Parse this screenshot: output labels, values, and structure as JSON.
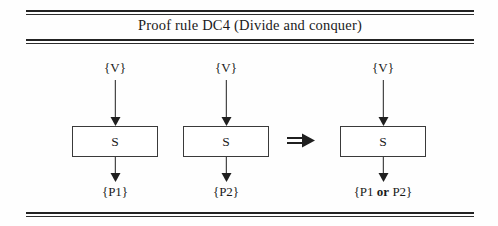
{
  "figure": {
    "title": "Proof rule DC4 (Divide and conquer)",
    "rules": {
      "top": "double-rule",
      "under_title": "double-rule",
      "bottom": "double-rule"
    },
    "colors": {
      "ink": "#1f1f1f",
      "rule": "#232323",
      "box_border": "#3a3a3a",
      "background": "#ffffff"
    },
    "operator": {
      "name": "implies-arrow",
      "glyph": "⇒",
      "meaning": "implies"
    },
    "columns": [
      {
        "id": "premise-1",
        "precondition": "{V}",
        "statement": "S",
        "postcondition": "{P1}",
        "postcondition_parts": [
          {
            "text": "{P1}",
            "bold": false
          }
        ]
      },
      {
        "id": "premise-2",
        "precondition": "{V}",
        "statement": "S",
        "postcondition": "{P2}",
        "postcondition_parts": [
          {
            "text": "{P2}",
            "bold": false
          }
        ]
      },
      {
        "id": "conclusion",
        "precondition": "{V}",
        "statement": "S",
        "postcondition": "{P1 or P2}",
        "postcondition_parts": [
          {
            "text": "{P1 ",
            "bold": false
          },
          {
            "text": "or",
            "bold": true
          },
          {
            "text": " P2}",
            "bold": false
          }
        ]
      }
    ],
    "arrow_labels": {
      "incoming": "flow-down-arrow",
      "outgoing": "flow-down-arrow"
    }
  }
}
